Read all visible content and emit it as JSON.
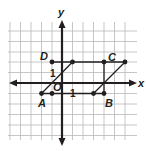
{
  "diagram": {
    "type": "coordinate-plane",
    "axes": {
      "x_label": "x",
      "y_label": "y"
    },
    "scale_labels": {
      "x_unit": "1",
      "y_unit": "1",
      "origin": "O"
    },
    "grid": {
      "x_range": [
        -5,
        6
      ],
      "y_range": [
        -5,
        5
      ],
      "step": 1
    },
    "points": [
      {
        "name": "A",
        "x": -2,
        "y": -1,
        "label": "A"
      },
      {
        "name": "O-adjacent",
        "x": -1,
        "y": -1,
        "label": ""
      },
      {
        "name": "D",
        "x": -1,
        "y": 2,
        "label": "D"
      },
      {
        "name": "P1",
        "x": 1,
        "y": 2,
        "label": ""
      },
      {
        "name": "C",
        "x": 4,
        "y": 2,
        "label": "C"
      },
      {
        "name": "P2",
        "x": 6,
        "y": 2,
        "label": ""
      },
      {
        "name": "P3",
        "x": 3,
        "y": -1,
        "label": ""
      },
      {
        "name": "B",
        "x": 4,
        "y": -1,
        "label": "B"
      }
    ],
    "segments": [
      {
        "from": [
          -1,
          2
        ],
        "to": [
          6,
          2
        ]
      },
      {
        "from": [
          -1,
          -1
        ],
        "to": [
          4,
          -1
        ]
      },
      {
        "from": [
          -2,
          -1
        ],
        "to": [
          -1,
          -1
        ]
      },
      {
        "from": [
          -2,
          -1
        ],
        "to": [
          1,
          2
        ]
      },
      {
        "from": [
          3,
          -1
        ],
        "to": [
          6,
          2
        ]
      },
      {
        "from": [
          4,
          2
        ],
        "to": [
          4,
          -1
        ]
      }
    ],
    "colors": {
      "ink": "#231f20",
      "grid": "#b5b5b5"
    }
  }
}
